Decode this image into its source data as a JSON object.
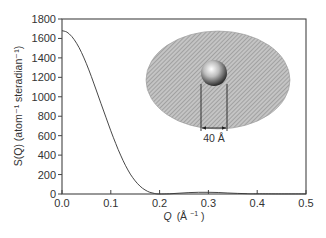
{
  "chart_data": {
    "type": "line",
    "title": "",
    "xlabel": "Q (Å⁻¹)",
    "ylabel": "S(Q) (atom⁻¹ steradian⁻¹)",
    "xlim": [
      0.0,
      0.5
    ],
    "ylim": [
      0,
      1800
    ],
    "x_ticks": [
      "0.0",
      "0.1",
      "0.2",
      "0.3",
      "0.4",
      "0.5"
    ],
    "y_ticks": [
      "0",
      "200",
      "400",
      "600",
      "800",
      "1000",
      "1200",
      "1400",
      "1600",
      "1800"
    ],
    "grid": false,
    "legend": null,
    "series": [
      {
        "name": "S(Q)",
        "x": [
          0.0,
          0.01,
          0.02,
          0.03,
          0.04,
          0.05,
          0.06,
          0.07,
          0.08,
          0.09,
          0.1,
          0.11,
          0.12,
          0.13,
          0.14,
          0.15,
          0.16,
          0.17,
          0.18,
          0.19,
          0.2,
          0.22,
          0.24,
          0.26,
          0.28,
          0.3,
          0.32,
          0.34,
          0.36,
          0.38,
          0.4,
          0.45,
          0.5
        ],
        "values": [
          1680,
          1665,
          1620,
          1550,
          1455,
          1340,
          1210,
          1070,
          930,
          790,
          650,
          520,
          400,
          295,
          205,
          135,
          80,
          42,
          18,
          5,
          0,
          2,
          8,
          14,
          18,
          18,
          15,
          10,
          6,
          3,
          2,
          1,
          1
        ]
      }
    ],
    "annotations": [
      {
        "type": "inset-illustration",
        "description": "grey hatched ellipse with a shaded sphere at centre",
        "label": "40 Å"
      }
    ]
  },
  "labels": {
    "x_axis_symbol": "Q",
    "x_axis_unit": "(Å",
    "x_axis_exp": "−1",
    "x_axis_close": ")",
    "y_axis_full": "S(Q) (atom⁻¹ steradian⁻¹)",
    "inset_dimension": "40 Å"
  }
}
